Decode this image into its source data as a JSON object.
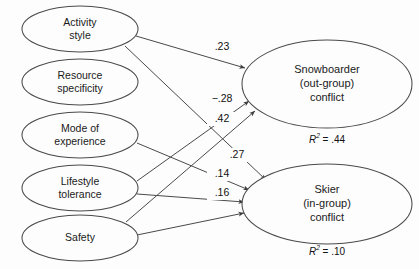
{
  "diagram": {
    "type": "path-diagram",
    "title": "",
    "stroke_color": "#4a4a4a",
    "text_color": "#1a1a1a",
    "background_color": "#fdfdfd",
    "predictors": [
      {
        "id": "activity-style",
        "line1": "Activity",
        "line2": "style",
        "cx": 80,
        "cy": 29,
        "rx": 58,
        "ry": 23
      },
      {
        "id": "resource-specificity",
        "line1": "Resource",
        "line2": "specificity",
        "cx": 80,
        "cy": 82,
        "rx": 58,
        "ry": 23
      },
      {
        "id": "mode-of-experience",
        "line1": "Mode of",
        "line2": "experience",
        "cx": 80,
        "cy": 135,
        "rx": 58,
        "ry": 23
      },
      {
        "id": "lifestyle-tolerance",
        "line1": "Lifestyle",
        "line2": "tolerance",
        "cx": 80,
        "cy": 188,
        "rx": 58,
        "ry": 23
      },
      {
        "id": "safety",
        "line1": "Safety",
        "line2": "",
        "cx": 80,
        "cy": 238,
        "rx": 58,
        "ry": 23
      }
    ],
    "outcomes": [
      {
        "id": "snowboarder-conflict",
        "line1": "Snowboarder",
        "line2": "(out-group)",
        "line3": "conflict",
        "cx": 327,
        "cy": 84,
        "rx": 85,
        "ry": 44,
        "r2_symbol": "R",
        "r2_exp": "2",
        "r2_eq": " = ",
        "r2_value": ".44",
        "r2_x": 327,
        "r2_y": 140
      },
      {
        "id": "skier-conflict",
        "line1": "Skier",
        "line2": "(in-group)",
        "line3": "conflict",
        "cx": 327,
        "cy": 204,
        "rx": 85,
        "ry": 40,
        "r2_symbol": "R",
        "r2_exp": "2",
        "r2_eq": " = ",
        "r2_value": ".10",
        "r2_x": 327,
        "r2_y": 252
      }
    ],
    "paths": [
      {
        "id": "activity-style-to-snowboarder",
        "from": "activity-style",
        "to": "snowboarder-conflict",
        "coefficient": ".23",
        "x1": 136,
        "y1": 36,
        "x2": 245,
        "y2": 68,
        "label_x": 222,
        "label_y": 47
      },
      {
        "id": "lifestyle-tolerance-to-snowboarder",
        "from": "lifestyle-tolerance",
        "to": "snowboarder-conflict",
        "coefficient": "−.28",
        "x1": 137,
        "y1": 181,
        "x2": 249,
        "y2": 101,
        "label_x": 222,
        "label_y": 99
      },
      {
        "id": "safety-to-snowboarder",
        "from": "safety",
        "to": "snowboarder-conflict",
        "coefficient": ".42",
        "x1": 126,
        "y1": 222,
        "x2": 255,
        "y2": 111,
        "label_x": 222,
        "label_y": 119
      },
      {
        "id": "activity-style-to-skier",
        "from": "activity-style",
        "to": "skier-conflict",
        "coefficient": ".27",
        "x1": 125,
        "y1": 46,
        "x2": 266,
        "y2": 180,
        "label_x": 237,
        "label_y": 155
      },
      {
        "id": "mode-of-experience-to-skier",
        "from": "mode-of-experience",
        "to": "skier-conflict",
        "coefficient": ".14",
        "x1": 137,
        "y1": 143,
        "x2": 249,
        "y2": 190,
        "label_x": 222,
        "label_y": 174
      },
      {
        "id": "lifestyle-tolerance-to-skier",
        "from": "lifestyle-tolerance",
        "to": "skier-conflict",
        "coefficient": ".16",
        "x1": 137,
        "y1": 194,
        "x2": 244,
        "y2": 202,
        "label_x": 222,
        "label_y": 193
      },
      {
        "id": "safety-to-skier",
        "from": "safety",
        "to": "skier-conflict",
        "coefficient": "",
        "x1": 137,
        "y1": 235,
        "x2": 244,
        "y2": 213,
        "label_x": 0,
        "label_y": 0
      }
    ]
  }
}
